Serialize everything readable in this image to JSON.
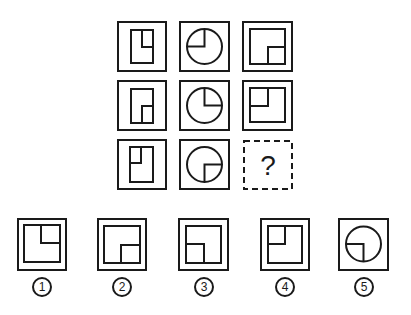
{
  "puzzle": {
    "grid": [
      [
        {
          "id": "r1c1",
          "type": "rect-tall",
          "notch": "top-right"
        },
        {
          "id": "r1c2",
          "type": "circle",
          "notch": "top-left"
        },
        {
          "id": "r1c3",
          "type": "rect-wide",
          "notch": "bottom-right"
        }
      ],
      [
        {
          "id": "r2c1",
          "type": "rect-tall",
          "notch": "bottom-right"
        },
        {
          "id": "r2c2",
          "type": "circle",
          "notch": "top-right"
        },
        {
          "id": "r2c3",
          "type": "rect-wide",
          "notch": "top-left"
        }
      ],
      [
        {
          "id": "r3c1",
          "type": "rect-tall",
          "notch": "top-left"
        },
        {
          "id": "r3c2",
          "type": "circle",
          "notch": "bottom-right"
        },
        {
          "id": "r3c3",
          "type": "unknown",
          "label": "?"
        }
      ]
    ],
    "question_mark": "?"
  },
  "options": [
    {
      "label": "①",
      "number": "1",
      "type": "rect-wide",
      "notch": "top-right"
    },
    {
      "label": "②",
      "number": "2",
      "type": "rect-wide",
      "notch": "bottom-right"
    },
    {
      "label": "③",
      "number": "3",
      "type": "rect-wide",
      "notch": "bottom-left"
    },
    {
      "label": "④",
      "number": "4",
      "type": "rect-wide",
      "notch": "top-left"
    },
    {
      "label": "⑤",
      "number": "5",
      "type": "circle",
      "notch": "bottom-left"
    }
  ],
  "colors": {
    "stroke": "#1a1a1a",
    "background": "#ffffff"
  }
}
